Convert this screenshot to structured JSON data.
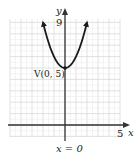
{
  "chart_data": {
    "type": "line",
    "title": "",
    "xlabel": "x",
    "ylabel": "y",
    "xlim": [
      -5,
      5
    ],
    "ylim": [
      -1,
      9.5
    ],
    "grid": true,
    "function": "y = x^2 + 5",
    "series": [
      {
        "name": "parabola",
        "x": [
          -2,
          -1.5,
          -1,
          -0.5,
          0,
          0.5,
          1,
          1.5,
          2
        ],
        "y": [
          9,
          7.25,
          6,
          5.25,
          5,
          5.25,
          6,
          7.25,
          9
        ]
      }
    ],
    "tick_labels": {
      "x": [
        "5"
      ],
      "y": [
        "9"
      ]
    },
    "annotations": [
      {
        "text": "V(0, 5)",
        "x": 0,
        "y": 5
      },
      {
        "text": "x = 0",
        "role": "axis of symmetry"
      }
    ],
    "colors": {
      "curve": "#222222",
      "axis": "#333333",
      "grid": "#d9d9d9"
    }
  },
  "labels": {
    "y_axis": "y",
    "x_axis": "x",
    "y_tick": "9",
    "x_tick": "5",
    "vertex": "V(0, 5)",
    "axis_of_symmetry": "x = 0"
  }
}
